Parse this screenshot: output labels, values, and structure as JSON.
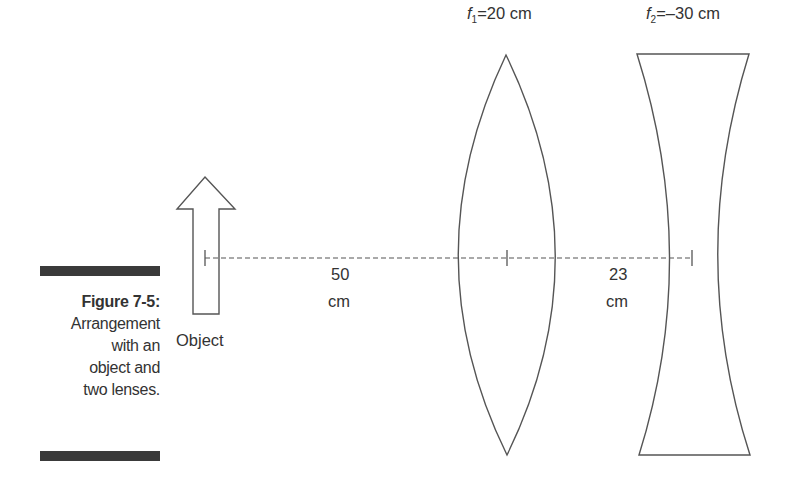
{
  "figure": {
    "number": "Figure 7-5:",
    "caption_lines": [
      "Arrangement",
      "with an",
      "object and",
      "two lenses."
    ]
  },
  "object": {
    "label": "Object"
  },
  "lens1": {
    "symbol": "f",
    "subscript": "1",
    "value": "=20 cm",
    "type": "converging"
  },
  "lens2": {
    "symbol": "f",
    "subscript": "2",
    "value": "=–30 cm",
    "type": "diverging"
  },
  "distances": [
    {
      "value": "50",
      "unit": "cm"
    },
    {
      "value": "23",
      "unit": "cm"
    }
  ],
  "colors": {
    "stroke": "#555555",
    "caption_bar": "#3a3a3a",
    "text": "#333333"
  }
}
